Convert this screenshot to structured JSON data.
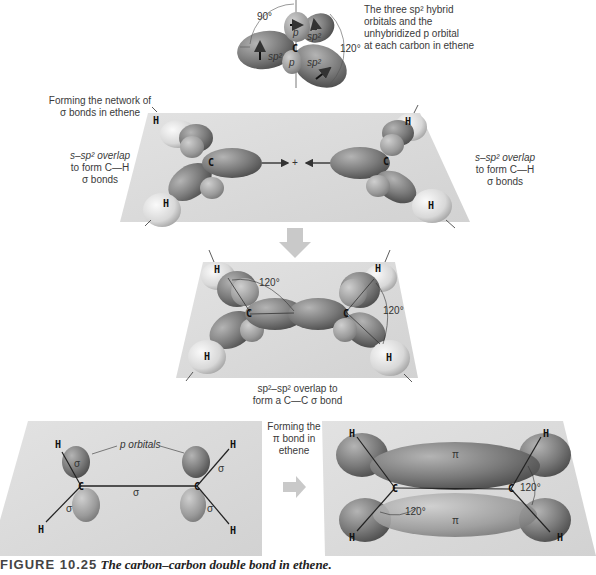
{
  "top_panel": {
    "description": "The three sp² hybrid orbitals and the unhybridized p orbital at each carbon in ethene",
    "desc_lines": [
      "The three sp² hybrid",
      "orbitals and the",
      "unhybridized p orbital",
      "at each carbon in ethene"
    ],
    "angle_90": "90°",
    "angle_120": "120°",
    "carbon": "C",
    "orbital_labels": [
      "p",
      "p",
      "sp²",
      "sp²",
      "sp²"
    ]
  },
  "sigma_network": {
    "heading_lines": [
      "Forming the network of",
      "σ bonds in ethene"
    ],
    "left_note_lines": [
      "s–sp² overlap",
      "to form C—H",
      "σ bonds"
    ],
    "right_note_lines": [
      "s–sp² overlap",
      "to form C—H",
      "σ bonds"
    ],
    "atoms": {
      "carbon": "C",
      "hydrogen": "H"
    },
    "plus": "+"
  },
  "sigma_bond": {
    "angle_left": "120°",
    "angle_right": "120°",
    "caption_lines": [
      "sp²–sp² overlap to",
      "form a C—C σ bond"
    ]
  },
  "bottom_left": {
    "p_orbitals_label": "p orbitals",
    "sigma": "σ"
  },
  "pi_step": {
    "label_lines": [
      "Forming the",
      "π bond in",
      "ethene"
    ]
  },
  "bottom_right": {
    "pi": "π",
    "angle_left": "120°",
    "angle_right": "120°"
  },
  "figure_caption": {
    "number": "FIGURE 10.25",
    "title": "The carbon–carbon double bond in ethene."
  },
  "colors": {
    "plane": "#d9d9d9",
    "orbital_dark": "#6e6e6e",
    "orbital_mid": "#9a9a9a",
    "hydrogen": "#e6e6e6",
    "arrow": "#c9c9c9"
  }
}
